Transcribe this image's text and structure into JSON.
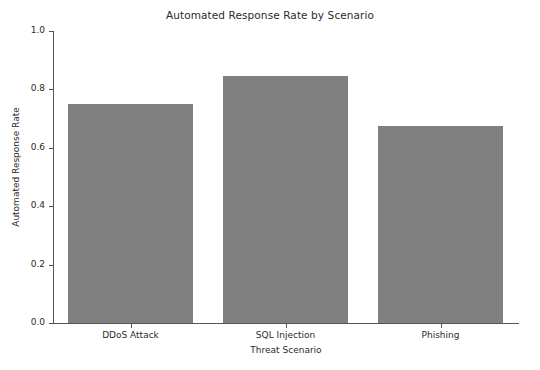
{
  "chart_data": {
    "type": "bar",
    "title": "Automated Response Rate by Scenario",
    "xlabel": "Threat Scenario",
    "ylabel": "Automated Response Rate",
    "categories": [
      "DDoS Attack",
      "SQL Injection",
      "Phishing"
    ],
    "values": [
      0.75,
      0.845,
      0.675
    ],
    "ylim": [
      0.0,
      1.0
    ],
    "yticks": [
      "0.0",
      "0.2",
      "0.4",
      "0.6",
      "0.8",
      "1.0"
    ],
    "ytick_values": [
      0.0,
      0.2,
      0.4,
      0.6,
      0.8,
      1.0
    ],
    "grid": false,
    "legend": null,
    "bar_color": "#808080",
    "axis_color": "#555555",
    "text_color": "#2b2b2b",
    "background": "#ffffff"
  }
}
